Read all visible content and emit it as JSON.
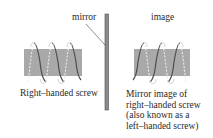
{
  "labels": {
    "mirror": "mirror",
    "image": "image"
  },
  "captions": {
    "left": "Right–handed screw",
    "right_lines": [
      "Mirror image of",
      "right–handed screw",
      "(also known as a",
      "left–handed screw)"
    ]
  },
  "colors": {
    "screw_body": "#a9a9a9",
    "thread_front": "#555555",
    "thread_back": "#e6e6e6",
    "mirror_fill": "#8c8c8c",
    "mirror_edge": "#4a4a4a",
    "text": "#2a2a2a"
  },
  "figure": {
    "left_screw": {
      "handedness": "right",
      "turns": 3
    },
    "right_screw": {
      "handedness": "left",
      "turns": 3
    },
    "mirror": {
      "orientation": "vertical"
    }
  }
}
